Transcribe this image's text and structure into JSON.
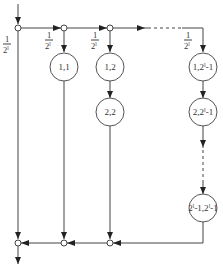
{
  "diagram": {
    "type": "signal-flow-tree",
    "input_weight": {
      "num": "1",
      "den": "2",
      "sup": "l"
    },
    "branch_weights": [
      {
        "num": "1",
        "den": "2",
        "sup": "l"
      },
      {
        "num": "1",
        "den": "2",
        "sup": "l"
      },
      {
        "num": "1",
        "den": "2",
        "sup": "l"
      }
    ],
    "columns": [
      {
        "id": "col1",
        "nodes": [
          "1,1"
        ]
      },
      {
        "id": "col2",
        "nodes": [
          "1,2",
          "2,2"
        ]
      },
      {
        "id": "colN",
        "nodes": [
          "1,2ˡ-1",
          "2,2ˡ-1",
          "2ˡ-1,2ˡ-1"
        ]
      }
    ],
    "node_labels": {
      "n11": "1,1",
      "n12": "1,2",
      "n22": "2,2",
      "n1N": "1,2",
      "n1N_sup": "l",
      "n1N_tail": "-1",
      "n2N": "2,2",
      "n2N_sup": "l",
      "n2N_tail": "-1",
      "nNN_a": "2",
      "nNN_a_sup": "l",
      "nNN_mid": "-1,2",
      "nNN_b_sup": "l",
      "nNN_tail": "-1"
    },
    "frac": {
      "num": "1",
      "den": "2",
      "sup": "l"
    }
  }
}
